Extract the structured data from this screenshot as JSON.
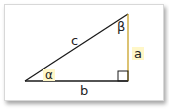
{
  "diagram": {
    "type": "right-triangle",
    "labels": {
      "hypotenuse": "c",
      "vertical_side": "a",
      "horizontal_side": "b",
      "angle_bottom_left": "α",
      "angle_top_right": "β"
    },
    "colors": {
      "line": "#1a1a1a",
      "side_a_line": "#c9a227",
      "highlight": "#fff7c8"
    }
  }
}
